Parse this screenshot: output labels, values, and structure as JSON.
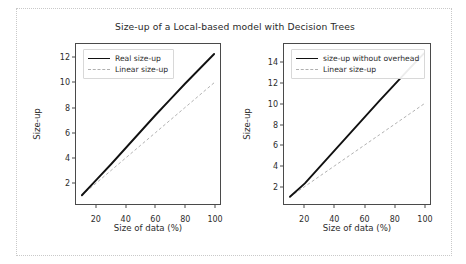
{
  "figure": {
    "title": "Size-up of a Local-based model with Decision Trees"
  },
  "chart_data": [
    {
      "type": "line",
      "panel": "left",
      "title": "",
      "xlabel": "Size of data (%)",
      "ylabel": "Size-up",
      "xlim": [
        6,
        104
      ],
      "ylim": [
        0.3,
        13.1
      ],
      "xticks": [
        "20",
        "40",
        "60",
        "80",
        "100"
      ],
      "xtick_values": [
        20,
        40,
        60,
        80,
        100
      ],
      "yticks": [
        "2",
        "4",
        "6",
        "8",
        "10",
        "12"
      ],
      "ytick_values": [
        2,
        4,
        6,
        8,
        10,
        12
      ],
      "grid": false,
      "legend_position": "upper left",
      "x": [
        10,
        20,
        30,
        40,
        50,
        60,
        70,
        80,
        90,
        100
      ],
      "series": [
        {
          "name": "Real size-up",
          "style": "solid",
          "color": "#111111",
          "values": [
            1.0,
            2.25,
            3.5,
            4.8,
            6.1,
            7.4,
            8.65,
            9.9,
            11.1,
            12.3
          ]
        },
        {
          "name": "Linear size-up",
          "style": "dashed",
          "color": "#b0b0b0",
          "values": [
            1.0,
            2.0,
            3.0,
            4.0,
            5.0,
            6.0,
            7.0,
            8.0,
            9.0,
            10.0
          ]
        }
      ]
    },
    {
      "type": "line",
      "panel": "right",
      "title": "",
      "xlabel": "Size of data (%)",
      "ylabel": "Size-up",
      "xlim": [
        6,
        104
      ],
      "ylim": [
        0.3,
        15.8
      ],
      "xticks": [
        "20",
        "40",
        "60",
        "80",
        "100"
      ],
      "xtick_values": [
        20,
        40,
        60,
        80,
        100
      ],
      "yticks": [
        "2",
        "4",
        "6",
        "8",
        "10",
        "12",
        "14"
      ],
      "ytick_values": [
        2,
        4,
        6,
        8,
        10,
        12,
        14
      ],
      "grid": false,
      "legend_position": "upper left",
      "x": [
        10,
        20,
        30,
        40,
        50,
        60,
        70,
        80,
        90,
        100
      ],
      "series": [
        {
          "name": "size-up without overhead",
          "style": "solid",
          "color": "#111111",
          "values": [
            1.0,
            2.3,
            3.9,
            5.5,
            7.1,
            8.7,
            10.3,
            11.85,
            13.4,
            14.9
          ]
        },
        {
          "name": "Linear size-up",
          "style": "dashed",
          "color": "#b0b0b0",
          "values": [
            1.0,
            2.0,
            3.0,
            4.0,
            5.0,
            6.0,
            7.0,
            8.0,
            9.0,
            10.0
          ]
        }
      ]
    }
  ]
}
